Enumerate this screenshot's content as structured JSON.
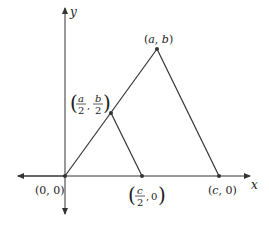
{
  "diagram": {
    "axes": {
      "x_label": "x",
      "y_label": "y"
    },
    "points": {
      "origin": {
        "label": "(0, 0)"
      },
      "apex": {
        "label": "(a, b)",
        "x": "a",
        "y": "b"
      },
      "mid_side": {
        "num_a": "a",
        "den_a": "2",
        "num_b": "b",
        "den_b": "2"
      },
      "mid_base": {
        "num": "c",
        "den": "2",
        "y": "0"
      },
      "base_end": {
        "label": "(c, 0)",
        "x": "c",
        "y": "0"
      }
    },
    "colors": {
      "line": "#333333",
      "point": "#333333",
      "background": "#ffffff"
    }
  }
}
